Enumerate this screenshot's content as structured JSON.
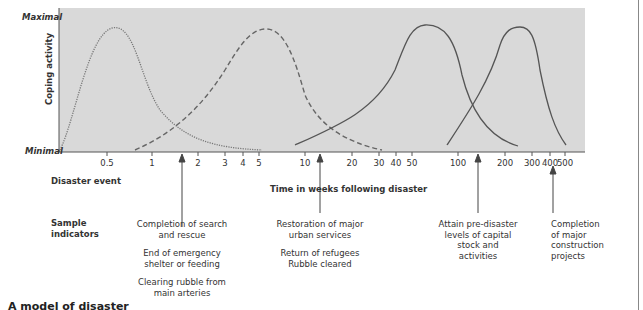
{
  "chart_data": {
    "type": "line",
    "title": "",
    "xlabel": "Time in weeks following disaster",
    "ylabel": "Coping activity",
    "y_axis": {
      "top_label": "Maximal",
      "bottom_label": "Minimal"
    },
    "x_scale": "log",
    "x_ticks": [
      "0.5",
      "1",
      "2",
      "3",
      "4",
      "5",
      "10",
      "20",
      "30",
      "40",
      "50",
      "100",
      "200",
      "300",
      "400",
      "500"
    ],
    "grid": false,
    "legend": null,
    "series": [
      {
        "name": "Emergency period",
        "style": "dotted",
        "start_weeks": 0.0,
        "peak_weeks": 0.6,
        "end_weeks": 5,
        "peak_level": "Maximal"
      },
      {
        "name": "Restoration period",
        "style": "dashed",
        "start_weeks": 0.8,
        "peak_weeks": 5,
        "end_weeks": 30,
        "peak_level": "Maximal"
      },
      {
        "name": "Reconstruction I",
        "style": "solid",
        "start_weeks": 8,
        "peak_weeks": 60,
        "end_weeks": 250,
        "peak_level": "Maximal"
      },
      {
        "name": "Reconstruction II",
        "style": "solid",
        "start_weeks": 80,
        "peak_weeks": 250,
        "end_weeks": 500,
        "peak_level": "Maximal"
      }
    ],
    "annotations": [
      {
        "x_weeks": 1.6,
        "label": "Completion of search and rescue"
      },
      {
        "x_weeks": 12,
        "label": "Restoration of major urban services"
      },
      {
        "x_weeks": 140,
        "label": "Attain pre-disaster levels of capital stock and activities"
      },
      {
        "x_weeks": 420,
        "label": "Completion of major construction projects"
      }
    ]
  },
  "axis": {
    "y_top": "Maximal",
    "y_bottom": "Minimal",
    "y_title": "Coping activity",
    "x_title": "Time in weeks following disaster",
    "ticks": [
      {
        "label": "0.5",
        "x": 107
      },
      {
        "label": "1",
        "x": 152
      },
      {
        "label": "2",
        "x": 198
      },
      {
        "label": "3",
        "x": 225
      },
      {
        "label": "4",
        "x": 243
      },
      {
        "label": "5",
        "x": 259
      },
      {
        "label": "10",
        "x": 305
      },
      {
        "label": "20",
        "x": 352
      },
      {
        "label": "30",
        "x": 379
      },
      {
        "label": "40",
        "x": 396
      },
      {
        "label": "50",
        "x": 412
      },
      {
        "label": "100",
        "x": 458
      },
      {
        "label": "200",
        "x": 505
      },
      {
        "label": "300",
        "x": 532
      },
      {
        "label": "400",
        "x": 550
      },
      {
        "label": "500",
        "x": 565
      }
    ]
  },
  "rows": {
    "disaster_event": "Disaster event",
    "sample_indicators_1": "Sample",
    "sample_indicators_2": "indicators"
  },
  "indicators": {
    "i1": [
      "Completion of search",
      "and rescue"
    ],
    "i1b": [
      "End of emergency",
      "shelter or feeding"
    ],
    "i1c": [
      "Clearing rubble from",
      "main arteries"
    ],
    "i2": [
      "Restoration of major",
      "urban services"
    ],
    "i2b": [
      "Return of refugees",
      "Rubble cleared"
    ],
    "i3": [
      "Attain pre-disaster",
      "levels of capital",
      "stock and",
      "activities"
    ],
    "i4": [
      "Completion",
      "of major",
      "construction",
      "projects"
    ]
  },
  "caption": "A model of disaster"
}
